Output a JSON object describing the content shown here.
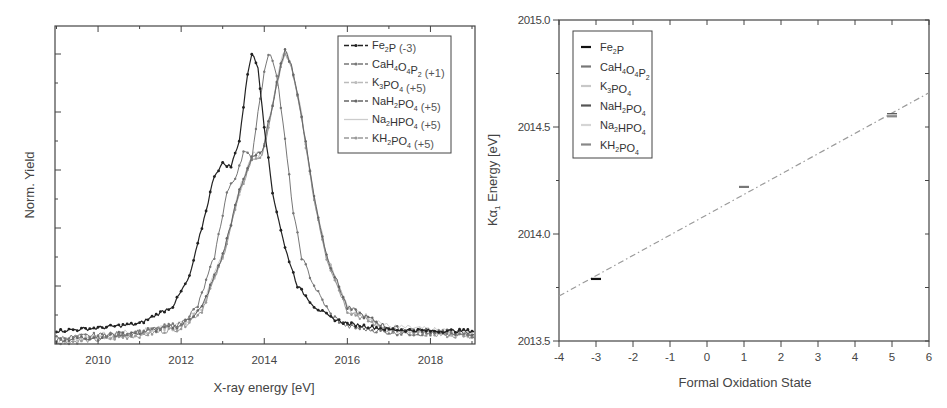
{
  "chart_data": [
    {
      "type": "line",
      "title": "",
      "xlabel": "X-ray energy [eV]",
      "ylabel": "Norm. Yield",
      "xlim": [
        2009,
        2019
      ],
      "ylim": [
        0,
        1.05
      ],
      "x_ticks": [
        "2010",
        "2012",
        "2014",
        "2016",
        "2018"
      ],
      "y_ticks_labeled": false,
      "grid": false,
      "legend_position": "upper right",
      "series": [
        {
          "name": "Fe2P (-3)",
          "label_main": "Fe",
          "sub": "2",
          "label_tail": "P",
          "suffix": " (-3)",
          "color": "#222222",
          "marker": "dot",
          "peak_x": 2013.7,
          "shoulder_x": 2013.0,
          "shoulder_y": 0.62,
          "baseline": 0.045,
          "x": [
            2009,
            2010,
            2011,
            2011.8,
            2012.2,
            2012.5,
            2012.8,
            2013.0,
            2013.2,
            2013.4,
            2013.6,
            2013.7,
            2013.85,
            2014.0,
            2014.2,
            2014.5,
            2014.8,
            2015.2,
            2015.6,
            2016,
            2017,
            2018,
            2019
          ],
          "y": [
            0.045,
            0.055,
            0.07,
            0.13,
            0.23,
            0.4,
            0.58,
            0.62,
            0.61,
            0.7,
            0.93,
            1.0,
            0.95,
            0.75,
            0.52,
            0.33,
            0.2,
            0.13,
            0.09,
            0.07,
            0.05,
            0.045,
            0.045
          ]
        },
        {
          "name": "CaH4O4P2 (+1)",
          "label_main": "CaH",
          "sub": "4",
          "label_tail": "O4P2",
          "suffix": " (+1)",
          "color": "#777777",
          "marker": "dot",
          "peak_x": 2014.15,
          "x": [
            2009,
            2010,
            2011,
            2012,
            2012.4,
            2012.8,
            2013.1,
            2013.3,
            2013.5,
            2013.7,
            2013.9,
            2014.05,
            2014.15,
            2014.3,
            2014.5,
            2014.7,
            2014.9,
            2015.2,
            2015.6,
            2016,
            2017,
            2019
          ],
          "y": [
            0.02,
            0.03,
            0.04,
            0.07,
            0.13,
            0.3,
            0.52,
            0.57,
            0.66,
            0.64,
            0.85,
            0.97,
            1.0,
            0.93,
            0.7,
            0.45,
            0.3,
            0.2,
            0.1,
            0.06,
            0.04,
            0.03
          ]
        },
        {
          "name": "K3PO4 (+5)",
          "label_main": "K",
          "sub": "3",
          "label_tail": "PO4",
          "suffix": " (+5)",
          "color": "#bbbbbb",
          "marker": "triangle",
          "peak_x": 2014.5,
          "x": [
            2009,
            2010,
            2011,
            2012,
            2012.5,
            2013,
            2013.4,
            2013.7,
            2013.95,
            2014.2,
            2014.4,
            2014.5,
            2014.65,
            2014.9,
            2015.2,
            2015.5,
            2016,
            2017,
            2019
          ],
          "y": [
            0.01,
            0.02,
            0.035,
            0.06,
            0.12,
            0.3,
            0.52,
            0.64,
            0.65,
            0.82,
            0.96,
            1.0,
            0.96,
            0.78,
            0.5,
            0.3,
            0.12,
            0.05,
            0.03
          ]
        },
        {
          "name": "NaH2PO4 (+5)",
          "label_main": "NaH",
          "sub": "2",
          "label_tail": "PO4",
          "suffix": " (+5)",
          "color": "#666666",
          "marker": "star",
          "peak_x": 2014.5
        },
        {
          "name": "Na2HPO4 (+5)",
          "label_main": "Na",
          "sub": "2",
          "label_tail": "HPO4",
          "suffix": " (+5)",
          "color": "#cccccc",
          "marker": "none",
          "peak_x": 2014.5
        },
        {
          "name": "KH2PO4 (+5)",
          "label_main": "KH",
          "sub": "2",
          "label_tail": "PO4",
          "suffix": " (+5)",
          "color": "#999999",
          "marker": "left-triangle",
          "peak_x": 2014.5
        }
      ]
    },
    {
      "type": "scatter",
      "title": "",
      "xlabel": "Formal Oxidation State",
      "ylabel": "Kα1 Energy [eV]",
      "xlim": [
        -4,
        6
      ],
      "ylim": [
        2013.5,
        2015.0
      ],
      "x_ticks": [
        "-4",
        "-3",
        "-2",
        "-1",
        "0",
        "1",
        "2",
        "3",
        "4",
        "5",
        "6"
      ],
      "y_ticks": [
        "2013.5",
        "2014.0",
        "2014.5",
        "2015.0"
      ],
      "grid": false,
      "legend_position": "upper left",
      "series": [
        {
          "name": "Fe2P",
          "x": [
            -3
          ],
          "y": [
            2013.79
          ],
          "color": "#111111"
        },
        {
          "name": "CaH4O4P2",
          "x": [
            1
          ],
          "y": [
            2014.22
          ],
          "color": "#777777"
        },
        {
          "name": "K3PO4",
          "x": [
            5
          ],
          "y": [
            2014.555
          ],
          "color": "#c8c8c8"
        },
        {
          "name": "NaH2PO4",
          "x": [
            5
          ],
          "y": [
            2014.56
          ],
          "color": "#555555"
        },
        {
          "name": "Na2HPO4",
          "x": [
            5
          ],
          "y": [
            2014.555
          ],
          "color": "#d5d5d5"
        },
        {
          "name": "KH2PO4",
          "x": [
            5
          ],
          "y": [
            2014.55
          ],
          "color": "#888888"
        }
      ],
      "fit_line": {
        "style": "dash-dot",
        "x": [
          -4,
          6
        ],
        "y": [
          2013.71,
          2014.66
        ],
        "color": "#999999"
      }
    }
  ],
  "left_plot": {
    "xlabel": "X-ray energy [eV]",
    "ylabel": "Norm. Yield",
    "x_ticks": [
      "2010",
      "2012",
      "2014",
      "2016",
      "2018"
    ],
    "legend": [
      {
        "main": "Fe",
        "sub": "2",
        "tail": "P",
        "subs2": "",
        "tail2": "",
        "suffix": " (-3)"
      },
      {
        "main": "CaH",
        "sub": "4",
        "tail": "O",
        "subs2": "4",
        "tail2": "P",
        "sub3": "2",
        "suffix": " (+1)"
      },
      {
        "main": "K",
        "sub": "3",
        "tail": "PO",
        "subs2": "4",
        "tail2": "",
        "suffix": " (+5)"
      },
      {
        "main": "NaH",
        "sub": "2",
        "tail": "PO",
        "subs2": "4",
        "tail2": "",
        "suffix": " (+5)"
      },
      {
        "main": "Na",
        "sub": "2",
        "tail": "HPO",
        "subs2": "4",
        "tail2": "",
        "suffix": " (+5)"
      },
      {
        "main": "KH",
        "sub": "2",
        "tail": "PO",
        "subs2": "4",
        "tail2": "",
        "suffix": " (+5)"
      }
    ]
  },
  "right_plot": {
    "xlabel": "Formal Oxidation State",
    "ylabel_main": "Kα",
    "ylabel_sub": "1",
    "ylabel_tail": " Energy [eV]",
    "x_ticks": [
      "-4",
      "-3",
      "-2",
      "-1",
      "0",
      "1",
      "2",
      "3",
      "4",
      "5",
      "6"
    ],
    "y_ticks": [
      "2013.5",
      "2014.0",
      "2014.5",
      "2015.0"
    ],
    "legend": [
      {
        "main": "Fe",
        "sub": "2",
        "tail": "P"
      },
      {
        "main": "CaH",
        "sub": "4",
        "tail": "O",
        "sub2": "4",
        "tail2": "P",
        "sub3": "2"
      },
      {
        "main": "K",
        "sub": "3",
        "tail": "PO",
        "sub2": "4"
      },
      {
        "main": "NaH",
        "sub": "2",
        "tail": "PO",
        "sub2": "4"
      },
      {
        "main": "Na",
        "sub": "2",
        "tail": "HPO",
        "sub2": "4"
      },
      {
        "main": "KH",
        "sub": "2",
        "tail": "PO",
        "sub2": "4"
      }
    ]
  }
}
